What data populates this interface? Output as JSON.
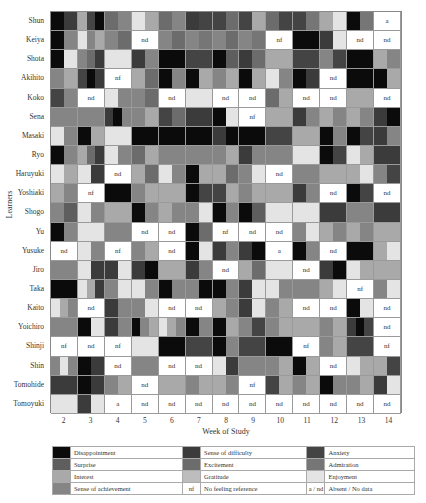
{
  "chart_data": {
    "type": "heatmap",
    "title": "",
    "xlabel": "Week of Study",
    "ylabel": "Learners",
    "x": [
      2,
      3,
      4,
      5,
      6,
      7,
      8,
      9,
      10,
      11,
      12,
      13,
      14
    ],
    "y": [
      "Shun",
      "Keiya",
      "Shota",
      "Akihito",
      "Koko",
      "Sena",
      "Masaki",
      "Ryo",
      "Haruyuki",
      "Yoshiaki",
      "Shogo",
      "Yu",
      "Yusuke",
      "Jiro",
      "Taka",
      "Kaito",
      "Yoichiro",
      "Shinji",
      "Shin",
      "Tomohide",
      "Tomoyuki"
    ],
    "categories": {
      "D": {
        "label": "Disappointment",
        "color": "#0b0b0b"
      },
      "SD": {
        "label": "Sense of difficulty",
        "color": "#3b3b3b",
        "textured": true
      },
      "AN": {
        "label": "Anxiety",
        "color": "#444444"
      },
      "SU": {
        "label": "Surprise",
        "color": "#5e5e5e"
      },
      "EX": {
        "label": "Excitement",
        "color": "#6c6c6c"
      },
      "AD": {
        "label": "Admiration",
        "color": "#767676"
      },
      "IN": {
        "label": "Interest",
        "color": "#a9a9a9"
      },
      "GR": {
        "label": "Gratitude",
        "color": "#bdbdbd"
      },
      "EN": {
        "label": "Enjoyment",
        "color": "#e4e4e4"
      },
      "SA": {
        "label": "Sense of achievement",
        "color": "#858585"
      },
      "nf": {
        "label": "No feeling reference"
      },
      "a/nd": {
        "label": "Absent / No data"
      }
    },
    "cells": {
      "Shun": [
        [
          "D",
          "SD"
        ],
        [
          "IN",
          "AN",
          "D"
        ],
        [
          "EX",
          "SA"
        ],
        [
          "EN",
          "IN"
        ],
        [
          "EX",
          "SA"
        ],
        [
          "SD",
          "AN"
        ],
        [
          "AN",
          "EX"
        ],
        [
          "AN",
          "IN"
        ],
        [
          "EX",
          "AN"
        ],
        [
          "AN",
          "AD"
        ],
        [
          "IN",
          "EN"
        ],
        [
          "D",
          "AD"
        ],
        "a"
      ],
      "Keiya": [
        [
          "D",
          "SA"
        ],
        [
          "EN",
          "SA",
          "IN"
        ],
        [
          "SA",
          "EX"
        ],
        "nd",
        [
          "SA",
          "EX"
        ],
        [
          "SA",
          "AD"
        ],
        [
          "SA",
          "EX"
        ],
        [
          "SA",
          "AD"
        ],
        "nf",
        [
          "D",
          "D"
        ],
        [
          "SD",
          "EN"
        ],
        "nd",
        "nd"
      ],
      "Shota": [
        [
          "D",
          "EN"
        ],
        [
          "SA",
          "EX",
          "SD"
        ],
        [
          "EN",
          "EN"
        ],
        [
          "SD",
          "SA"
        ],
        [
          "D",
          "D"
        ],
        [
          "AN",
          "AN"
        ],
        [
          "D",
          "SU"
        ],
        [
          "SD",
          "EX"
        ],
        [
          "IN",
          "IN"
        ],
        [
          "AN",
          "AN"
        ],
        [
          "SA",
          "AN"
        ],
        [
          "D",
          "D"
        ],
        [
          "IN",
          "SA"
        ]
      ],
      "Akihito": [
        [
          "SA",
          "IN"
        ],
        [
          "AN",
          "D",
          "SD"
        ],
        "nf",
        [
          "IN",
          "EX"
        ],
        [
          "D",
          "SA"
        ],
        [
          "D",
          "IN"
        ],
        [
          "SA",
          "IN"
        ],
        [
          "D",
          "IN"
        ],
        [
          "EN",
          "SA"
        ],
        [
          "D",
          "SD"
        ],
        "nd",
        [
          "D",
          "D"
        ],
        [
          "D",
          "IN"
        ]
      ],
      "Koko": [
        [
          "AN",
          "SA"
        ],
        "nd",
        [
          "EN",
          "SA"
        ],
        [
          "SA",
          "EX"
        ],
        "nd",
        [
          "EN",
          "EN"
        ],
        "nd",
        "nd",
        [
          "EX",
          "IN"
        ],
        "nd",
        "nd",
        [
          "IN",
          "IN"
        ],
        "nd"
      ],
      "Sena": [
        [
          "SA",
          "SA"
        ],
        [
          "SA",
          "SA"
        ],
        [
          "SD",
          "D",
          "SA"
        ],
        [
          "SA",
          "IN"
        ],
        [
          "AN",
          "EX"
        ],
        [
          "SD",
          "SD"
        ],
        [
          "D",
          "EN"
        ],
        "nf",
        [
          "IN",
          "IN"
        ],
        [
          "SD",
          "SA"
        ],
        [
          "IN",
          "SA"
        ],
        [
          "IN",
          "SA"
        ],
        [
          "SD",
          "D"
        ]
      ],
      "Masaki": [
        [
          "EN",
          "SA"
        ],
        [
          "D",
          "IN"
        ],
        [
          "EN",
          "EN"
        ],
        [
          "D",
          "D"
        ],
        [
          "D",
          "D"
        ],
        [
          "D",
          "D"
        ],
        [
          "SD",
          "D"
        ],
        [
          "D",
          "D"
        ],
        [
          "AN",
          "AN"
        ],
        [
          "IN",
          "IN"
        ],
        [
          "D",
          "SA"
        ],
        [
          "D",
          "AN"
        ],
        [
          "SD",
          "SA"
        ]
      ],
      "Ryo": [
        [
          "D",
          "SA"
        ],
        [
          "IN",
          "EX",
          "SD"
        ],
        [
          "EN",
          "SA"
        ],
        [
          "EX",
          "IN"
        ],
        [
          "SA",
          "SA"
        ],
        [
          "SA",
          "SA"
        ],
        [
          "SA",
          "IN"
        ],
        [
          "SD",
          "SA"
        ],
        [
          "SA",
          "SA"
        ],
        [
          "EN",
          "EN"
        ],
        [
          "D",
          "AN"
        ],
        [
          "EN",
          "IN"
        ],
        [
          "SD",
          "SD"
        ]
      ],
      "Haruyuki": [
        [
          "EN",
          "IN"
        ],
        [
          "EN",
          "SD"
        ],
        "nd",
        [
          "IN",
          "EX"
        ],
        [
          "EN",
          "SA"
        ],
        [
          "D",
          "IN"
        ],
        [
          "IN",
          "EX"
        ],
        [
          "SA",
          "EN"
        ],
        "nd",
        [
          "SA",
          "SA"
        ],
        [
          "IN",
          "IN"
        ],
        [
          "IN",
          "EN"
        ],
        [
          "SA",
          "AN"
        ]
      ],
      "Yoshiaki": [
        [
          "IN",
          "SA"
        ],
        "nf",
        [
          "D",
          "D"
        ],
        [
          "SA",
          "IN"
        ],
        [
          "IN",
          "IN"
        ],
        [
          "D",
          "AN"
        ],
        [
          "AN",
          "IN"
        ],
        [
          "SA",
          "IN"
        ],
        [
          "IN",
          "IN"
        ],
        [
          "SD",
          "SA"
        ],
        "nd",
        [
          "D",
          "AN"
        ],
        "nd"
      ],
      "Shogo": [
        [
          "SA",
          "SU"
        ],
        [
          "EN",
          "SA"
        ],
        [
          "IN",
          "IN"
        ],
        [
          "D",
          "SA"
        ],
        [
          "IN",
          "SA"
        ],
        [
          "SA",
          "EN"
        ],
        [
          "D",
          "SA"
        ],
        [
          "D",
          "SU"
        ],
        [
          "EN",
          "EN"
        ],
        [
          "EN",
          "EN"
        ],
        [
          "SD",
          "SD"
        ],
        [
          "SA",
          "SA"
        ],
        [
          "SD",
          "SD"
        ]
      ],
      "Yu": [
        [
          "D",
          "SA"
        ],
        [
          "EN",
          "EN"
        ],
        [
          "SA",
          "SA"
        ],
        "nd",
        "nd",
        [
          "D",
          "EX"
        ],
        "nf",
        "nd",
        "nd",
        [
          "SA",
          "EN"
        ],
        [
          "IN",
          "SA"
        ],
        [
          "IN",
          "SA"
        ],
        [
          "IN",
          "IN"
        ]
      ],
      "Yusuke": [
        "nd",
        [
          "EN",
          "SA"
        ],
        "nf",
        [
          "SA",
          "IN"
        ],
        "nd",
        [
          "D",
          "EN"
        ],
        [
          "SD",
          "SA"
        ],
        [
          "SD",
          "D"
        ],
        "a",
        [
          "D",
          "SA"
        ],
        "nd",
        [
          "D",
          "D"
        ],
        [
          "IN",
          "EN"
        ]
      ],
      "Jiro": [
        [
          "SA",
          "SA"
        ],
        [
          "EN",
          "SD"
        ],
        [
          "SD",
          "EN"
        ],
        [
          "SD",
          "D"
        ],
        [
          "IN",
          "IN"
        ],
        [
          "SD",
          "SA"
        ],
        "nd",
        [
          "IN",
          "EX"
        ],
        [
          "EN",
          "EN"
        ],
        "nd",
        [
          "SD",
          "D"
        ],
        [
          "EN",
          "IN"
        ],
        [
          "IN",
          "IN"
        ]
      ],
      "Taka": [
        [
          "D",
          "D"
        ],
        [
          "EN",
          "IN",
          "SD"
        ],
        [
          "SA",
          "EN"
        ],
        [
          "EN",
          "SA"
        ],
        [
          "D",
          "SA"
        ],
        [
          "SA",
          "D"
        ],
        [
          "D",
          "SA"
        ],
        [
          "SD",
          "EN"
        ],
        [
          "EN",
          "SA"
        ],
        [
          "SA",
          "SA"
        ],
        [
          "IN",
          "EN"
        ],
        "nf",
        [
          "SA",
          "EN"
        ]
      ],
      "Kaito": [
        [
          "EN",
          "IN",
          "SA"
        ],
        "nd",
        [
          "SD",
          "SA"
        ],
        [
          "SA",
          "EN"
        ],
        "nd",
        "nd",
        [
          "IN",
          "SA"
        ],
        [
          "SD",
          "EN"
        ],
        [
          "SA",
          "IN"
        ],
        "nd",
        "nd",
        [
          "D",
          "EN"
        ],
        "nd"
      ],
      "Yoichiro": [
        [
          "SA",
          "SA"
        ],
        [
          "D",
          "EN"
        ],
        [
          "SD",
          "SA"
        ],
        [
          "D",
          "SA",
          "IN"
        ],
        [
          "EN",
          "IN",
          "SA"
        ],
        [
          "D",
          "SA"
        ],
        [
          "D",
          "IN"
        ],
        [
          "SA",
          "AN"
        ],
        [
          "SA",
          "IN"
        ],
        [
          "IN",
          "IN"
        ],
        [
          "SA",
          "IN"
        ],
        [
          "SD",
          "D",
          "AN"
        ],
        "nd"
      ],
      "Shinji": [
        "nf",
        "nd",
        "nf",
        [
          "EN",
          "EN"
        ],
        [
          "D",
          "D"
        ],
        [
          "AN",
          "AN"
        ],
        [
          "D",
          "SA"
        ],
        [
          "AN",
          "AN"
        ],
        [
          "D",
          "D"
        ],
        "nf",
        [
          "SA",
          "IN"
        ],
        [
          "AN",
          "AN"
        ],
        "nf"
      ],
      "Shin": [
        [
          "SA",
          "EN",
          "SA"
        ],
        [
          "D",
          "SD"
        ],
        "nd",
        [
          "SA",
          "SA"
        ],
        "nd",
        "nd",
        [
          "EN",
          "SD"
        ],
        [
          "SA",
          "SA"
        ],
        [
          "SA",
          "IN"
        ],
        [
          "D",
          "IN"
        ],
        "nd",
        [
          "EN",
          "IN"
        ],
        [
          "IN",
          "AN"
        ]
      ],
      "Tomohide": [
        [
          "SD",
          "SD"
        ],
        [
          "D",
          "SD"
        ],
        [
          "SA",
          "IN"
        ],
        "nd",
        [
          "IN",
          "IN"
        ],
        [
          "SA",
          "IN"
        ],
        [
          "IN",
          "SA"
        ],
        "nf",
        [
          "AN",
          "IN"
        ],
        [
          "SA",
          "IN"
        ],
        [
          "D",
          "SA"
        ],
        [
          "SA",
          "IN"
        ],
        [
          "SD",
          "EN"
        ]
      ],
      "Tomoyuki": [
        [
          "EN",
          "EN"
        ],
        [
          "SD",
          "EN"
        ],
        "a",
        "nd",
        "nd",
        "nd",
        "nd",
        "nd",
        "nd",
        "nd",
        "nd",
        "nd",
        "nd"
      ]
    },
    "legend_position": "bottom",
    "grid": true
  },
  "axis": {
    "xlabel": "Week of Study",
    "ylabel": "Learners",
    "xticks": [
      "2",
      "3",
      "4",
      "5",
      "6",
      "7",
      "8",
      "9",
      "10",
      "11",
      "12",
      "13",
      "14"
    ]
  },
  "legend": {
    "rows": [
      [
        {
          "swatch": "D",
          "label": "Disappointment"
        },
        {
          "swatch": "SD",
          "label": "Sense of difficulty"
        },
        {
          "swatch": "AN",
          "label": "Anxiety"
        }
      ],
      [
        {
          "swatch": "SU",
          "label": "Surprise"
        },
        {
          "swatch": "EX",
          "label": "Excitement"
        },
        {
          "swatch": "AD",
          "label": "Admiration"
        }
      ],
      [
        {
          "swatch": "IN",
          "label": "Interest"
        },
        {
          "swatch": "GR",
          "label": "Gratitude"
        },
        {
          "swatch": "EN",
          "label": "Enjoyment"
        }
      ],
      [
        {
          "swatch": "SA",
          "label": "Sense of achievement"
        },
        {
          "code": "nf",
          "label": "No feeling reference"
        },
        {
          "code": "a / nd",
          "label": "Absent / No data"
        }
      ]
    ]
  }
}
